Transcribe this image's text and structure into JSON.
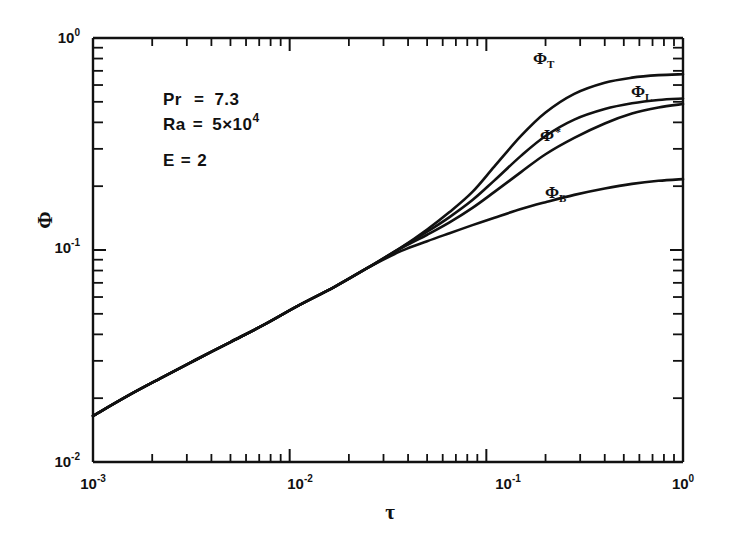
{
  "figure": {
    "background": "#ffffff",
    "ink_color": "#111111"
  },
  "axes": {
    "x": {
      "label": "τ",
      "type": "log",
      "min": 0.001,
      "max": 1.0,
      "tick_labels": [
        "10",
        "10",
        "10",
        "10"
      ],
      "tick_exponents": [
        "-3",
        "-2",
        "-1",
        "0"
      ],
      "tick_values": [
        0.001,
        0.01,
        0.1,
        1.0
      ]
    },
    "y": {
      "label": "Φ",
      "type": "log",
      "min": 0.01,
      "max": 1.0,
      "tick_labels": [
        "10",
        "10",
        "10"
      ],
      "tick_exponents": [
        "0",
        "-1",
        "-2"
      ],
      "tick_values": [
        1.0,
        0.1,
        0.01
      ]
    }
  },
  "annotations": {
    "line1_symbol": "Pr",
    "line1_eq": "=",
    "line1_value": "7.3",
    "line2_symbol": "Ra",
    "line2_eq": "=",
    "line2_value": "5×10",
    "line2_exp": "4",
    "line3_symbol": "E",
    "line3_eq": "=",
    "line3_value": "2"
  },
  "curve_labels": {
    "phi_t_base": "Φ",
    "phi_t_sub": "T",
    "phi_l_base": "Φ",
    "phi_l_sub": "L",
    "phi_star_base": "Φ",
    "phi_star_sup": "*",
    "phi_b_base": "Φ",
    "phi_b_sub": "B"
  },
  "chart_data": {
    "type": "line",
    "title": "",
    "xlabel": "τ",
    "ylabel": "Φ",
    "xscale": "log",
    "yscale": "log",
    "xlim": [
      0.001,
      1.0
    ],
    "ylim": [
      0.01,
      1.0
    ],
    "grid": false,
    "legend": "inline-curve-labels",
    "parameters": {
      "Pr": 7.3,
      "Ra": 50000,
      "E": 2
    },
    "series": [
      {
        "name": "Φ_T",
        "label_position": {
          "x": 0.28,
          "y": 0.8
        },
        "x": [
          0.001,
          0.0015,
          0.0022,
          0.0033,
          0.005,
          0.0075,
          0.011,
          0.017,
          0.025,
          0.037,
          0.05,
          0.065,
          0.085,
          0.11,
          0.15,
          0.2,
          0.28,
          0.4,
          0.55,
          0.75,
          1.0
        ],
        "y": [
          0.0165,
          0.0205,
          0.0248,
          0.0302,
          0.0368,
          0.0447,
          0.0545,
          0.0672,
          0.0825,
          0.103,
          0.125,
          0.151,
          0.188,
          0.248,
          0.345,
          0.445,
          0.545,
          0.615,
          0.65,
          0.668,
          0.675
        ]
      },
      {
        "name": "Φ_L",
        "label_position": {
          "x": 0.5,
          "y": 0.5
        },
        "x": [
          0.001,
          0.0015,
          0.0022,
          0.0033,
          0.005,
          0.0075,
          0.011,
          0.017,
          0.025,
          0.037,
          0.05,
          0.065,
          0.085,
          0.11,
          0.15,
          0.2,
          0.28,
          0.4,
          0.55,
          0.75,
          1.0
        ],
        "y": [
          0.0165,
          0.0205,
          0.0248,
          0.0302,
          0.0368,
          0.0447,
          0.0545,
          0.0672,
          0.0825,
          0.103,
          0.122,
          0.143,
          0.172,
          0.213,
          0.278,
          0.345,
          0.412,
          0.462,
          0.492,
          0.51,
          0.518
        ]
      },
      {
        "name": "Φ*",
        "label_position": {
          "x": 0.22,
          "y": 0.345
        },
        "x": [
          0.001,
          0.0015,
          0.0022,
          0.0033,
          0.005,
          0.0075,
          0.011,
          0.017,
          0.025,
          0.037,
          0.05,
          0.065,
          0.085,
          0.11,
          0.15,
          0.2,
          0.28,
          0.4,
          0.55,
          0.75,
          1.0
        ],
        "y": [
          0.0165,
          0.0205,
          0.0248,
          0.0302,
          0.0368,
          0.0447,
          0.0545,
          0.0672,
          0.0825,
          0.102,
          0.118,
          0.135,
          0.158,
          0.188,
          0.233,
          0.283,
          0.338,
          0.395,
          0.44,
          0.47,
          0.488
        ]
      },
      {
        "name": "Φ_B",
        "label_position": {
          "x": 0.3,
          "y": 0.175
        },
        "x": [
          0.001,
          0.0015,
          0.0022,
          0.0033,
          0.005,
          0.0075,
          0.011,
          0.017,
          0.025,
          0.037,
          0.05,
          0.065,
          0.085,
          0.11,
          0.15,
          0.2,
          0.28,
          0.4,
          0.55,
          0.75,
          1.0
        ],
        "y": [
          0.0165,
          0.0205,
          0.0248,
          0.0302,
          0.0368,
          0.0447,
          0.0545,
          0.0672,
          0.0825,
          0.099,
          0.11,
          0.12,
          0.131,
          0.142,
          0.156,
          0.168,
          0.182,
          0.195,
          0.205,
          0.212,
          0.216
        ]
      }
    ]
  }
}
